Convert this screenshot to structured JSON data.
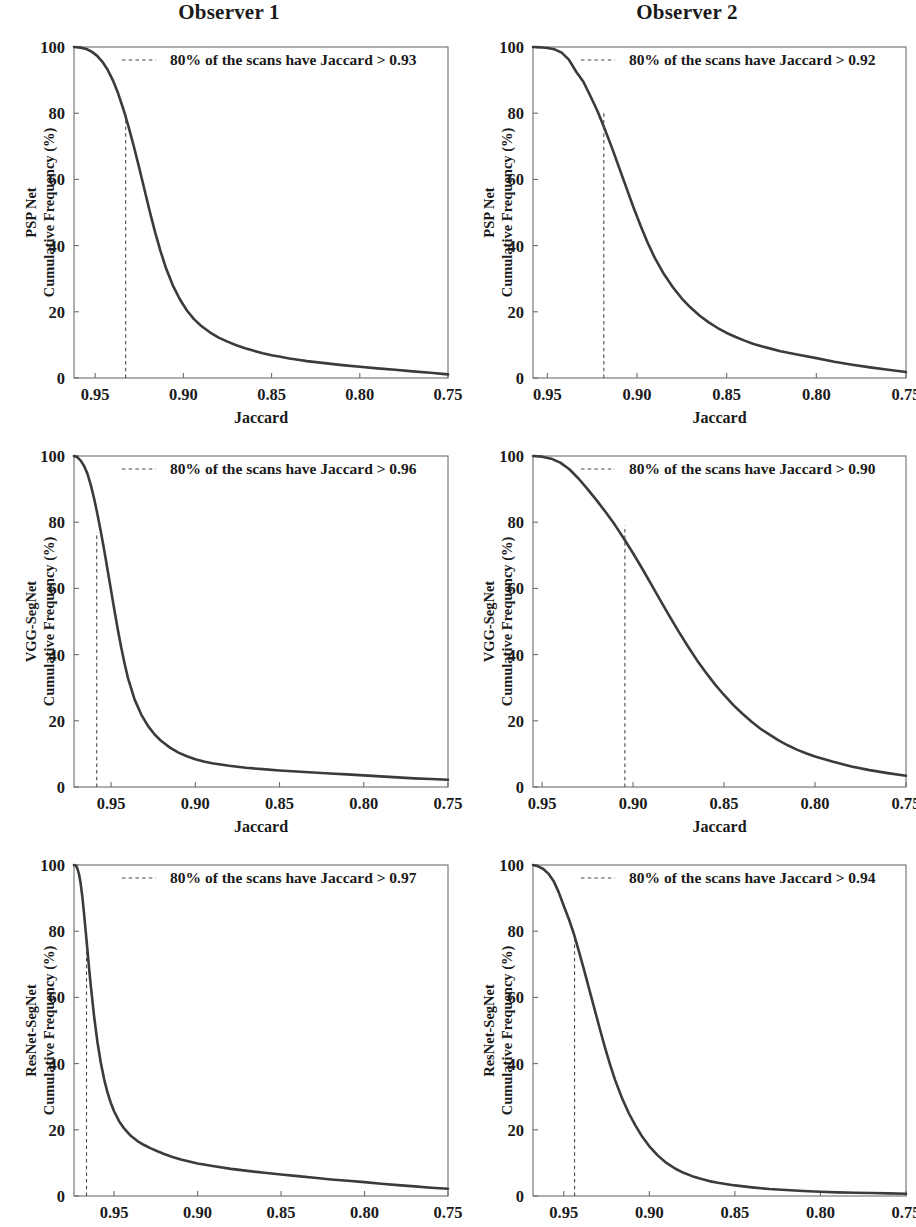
{
  "figure": {
    "column_titles": [
      "Observer 1",
      "Observer 2"
    ],
    "x_axis_title": "Jaccard",
    "y_axis_title_suffix": "Cumulative Frequency (%)",
    "row_models": [
      "PSP Net",
      "VGG-SegNet",
      "ResNet-SegNet"
    ],
    "curve_color": "#3b3b3b",
    "frame_color": "#6d6d6d",
    "dash_color": "#4a4a4a"
  },
  "chart_data": [
    {
      "id": "psp-observer1",
      "type": "line",
      "title": "Observer 1",
      "model": "PSP Net",
      "observer": "Observer 1",
      "xlabel": "Jaccard",
      "ylabel": "PSP Net Cumulative Frequency (%)",
      "xlim": [
        0.962,
        0.75
      ],
      "ylim": [
        0,
        100
      ],
      "xticks": [
        0.95,
        0.9,
        0.85,
        0.8,
        0.75
      ],
      "xticklabels": [
        "0.95",
        "0.90",
        "0.85",
        "0.80",
        "0.75"
      ],
      "yticks": [
        0,
        20,
        40,
        60,
        80,
        100
      ],
      "yticklabels": [
        "0",
        "20",
        "40",
        "60",
        "80",
        "100"
      ],
      "grid": false,
      "legend_position": "upper-center",
      "annotation": "80% of the scans have Jaccard > 0.93",
      "threshold_x": 0.9327,
      "threshold_y": 80,
      "x": [
        0.962,
        0.958,
        0.955,
        0.952,
        0.949,
        0.946,
        0.943,
        0.94,
        0.937,
        0.934,
        0.931,
        0.928,
        0.925,
        0.922,
        0.919,
        0.916,
        0.913,
        0.91,
        0.906,
        0.902,
        0.898,
        0.894,
        0.89,
        0.885,
        0.88,
        0.875,
        0.87,
        0.865,
        0.86,
        0.855,
        0.85,
        0.845,
        0.84,
        0.835,
        0.83,
        0.82,
        0.81,
        0.8,
        0.79,
        0.78,
        0.77,
        0.76,
        0.75
      ],
      "y": [
        100,
        99.8,
        99.4,
        98.6,
        97.4,
        95.6,
        93.2,
        90.0,
        86.0,
        81.2,
        75.8,
        69.8,
        63.4,
        56.8,
        50.2,
        44.0,
        38.4,
        33.4,
        28.0,
        23.8,
        20.4,
        17.8,
        15.8,
        13.8,
        12.2,
        11.0,
        9.9,
        9.0,
        8.2,
        7.5,
        6.9,
        6.4,
        5.9,
        5.5,
        5.1,
        4.5,
        3.9,
        3.4,
        2.9,
        2.5,
        2.0,
        1.6,
        1.1
      ]
    },
    {
      "id": "psp-observer2",
      "type": "line",
      "title": "Observer 2",
      "model": "PSP Net",
      "observer": "Observer 2",
      "xlabel": "Jaccard",
      "ylabel": "PSP Net Cumulative Frequency (%)",
      "xlim": [
        0.958,
        0.75
      ],
      "ylim": [
        0,
        100
      ],
      "xticks": [
        0.95,
        0.9,
        0.85,
        0.8,
        0.75
      ],
      "xticklabels": [
        "0.95",
        "0.90",
        "0.85",
        "0.80",
        "0.75"
      ],
      "yticks": [
        0,
        20,
        40,
        60,
        80,
        100
      ],
      "yticklabels": [
        "0",
        "20",
        "40",
        "60",
        "80",
        "100"
      ],
      "grid": false,
      "legend_position": "upper-center",
      "annotation": "80% of the scans have Jaccard > 0.92",
      "threshold_x": 0.9185,
      "threshold_y": 80,
      "x": [
        0.958,
        0.954,
        0.95,
        0.946,
        0.942,
        0.938,
        0.934,
        0.93,
        0.926,
        0.922,
        0.918,
        0.914,
        0.91,
        0.906,
        0.902,
        0.898,
        0.894,
        0.89,
        0.885,
        0.88,
        0.875,
        0.87,
        0.865,
        0.86,
        0.855,
        0.85,
        0.845,
        0.84,
        0.835,
        0.83,
        0.825,
        0.82,
        0.81,
        0.8,
        0.79,
        0.78,
        0.77,
        0.76,
        0.75
      ],
      "y": [
        100,
        99.9,
        99.7,
        99.3,
        98.3,
        96.2,
        92.6,
        89.6,
        85.2,
        80.6,
        75.2,
        69.6,
        63.6,
        57.6,
        51.6,
        46.0,
        40.8,
        36.2,
        31.4,
        27.4,
        24.0,
        21.2,
        18.8,
        16.8,
        15.1,
        13.6,
        12.4,
        11.3,
        10.3,
        9.5,
        8.8,
        8.1,
        7.0,
        6.0,
        4.9,
        4.0,
        3.2,
        2.5,
        1.8
      ]
    },
    {
      "id": "vgg-observer1",
      "type": "line",
      "title": "Observer 1",
      "model": "VGG-SegNet",
      "observer": "Observer 1",
      "xlabel": "Jaccard",
      "ylabel": "VGG-SegNet Cumulative Frequency (%)",
      "xlim": [
        0.972,
        0.75
      ],
      "ylim": [
        0,
        100
      ],
      "xticks": [
        0.95,
        0.9,
        0.85,
        0.8,
        0.75
      ],
      "xticklabels": [
        "0.95",
        "0.90",
        "0.85",
        "0.80",
        "0.75"
      ],
      "yticks": [
        0,
        20,
        40,
        60,
        80,
        100
      ],
      "yticklabels": [
        "0",
        "20",
        "40",
        "60",
        "80",
        "100"
      ],
      "grid": false,
      "legend_position": "upper-center",
      "annotation": "80% of the scans have Jaccard > 0.96",
      "threshold_x": 0.9585,
      "threshold_y": 77,
      "x": [
        0.972,
        0.97,
        0.968,
        0.966,
        0.964,
        0.962,
        0.96,
        0.958,
        0.956,
        0.954,
        0.952,
        0.95,
        0.948,
        0.946,
        0.944,
        0.942,
        0.94,
        0.936,
        0.932,
        0.928,
        0.924,
        0.92,
        0.915,
        0.91,
        0.905,
        0.9,
        0.895,
        0.89,
        0.88,
        0.87,
        0.86,
        0.85,
        0.84,
        0.83,
        0.82,
        0.81,
        0.8,
        0.79,
        0.78,
        0.77,
        0.76,
        0.75
      ],
      "y": [
        100,
        99.6,
        98.6,
        97.0,
        94.6,
        91.2,
        87.0,
        82.2,
        77.0,
        71.4,
        65.4,
        59.4,
        53.4,
        47.6,
        42.2,
        37.4,
        33.0,
        26.4,
        21.8,
        18.4,
        15.8,
        13.8,
        11.9,
        10.4,
        9.3,
        8.4,
        7.7,
        7.2,
        6.4,
        5.8,
        5.4,
        5.0,
        4.7,
        4.4,
        4.1,
        3.8,
        3.5,
        3.2,
        2.9,
        2.6,
        2.4,
        2.2
      ]
    },
    {
      "id": "vgg-observer2",
      "type": "line",
      "title": "Observer 2",
      "model": "VGG-SegNet",
      "observer": "Observer 2",
      "xlabel": "Jaccard",
      "ylabel": "VGG-SegNet Cumulative Frequency (%)",
      "xlim": [
        0.955,
        0.75
      ],
      "ylim": [
        0,
        100
      ],
      "xticks": [
        0.95,
        0.9,
        0.85,
        0.8,
        0.75
      ],
      "xticklabels": [
        "0.95",
        "0.90",
        "0.85",
        "0.80",
        "0.75"
      ],
      "yticks": [
        0,
        20,
        40,
        60,
        80,
        100
      ],
      "yticklabels": [
        "0",
        "20",
        "40",
        "60",
        "80",
        "100"
      ],
      "grid": false,
      "legend_position": "upper-center",
      "annotation": "80% of the scans have Jaccard > 0.90",
      "threshold_x": 0.9045,
      "threshold_y": 79,
      "x": [
        0.955,
        0.95,
        0.945,
        0.94,
        0.935,
        0.93,
        0.925,
        0.92,
        0.915,
        0.91,
        0.905,
        0.9,
        0.895,
        0.89,
        0.885,
        0.88,
        0.875,
        0.87,
        0.865,
        0.86,
        0.855,
        0.85,
        0.845,
        0.84,
        0.835,
        0.83,
        0.825,
        0.82,
        0.815,
        0.81,
        0.805,
        0.8,
        0.79,
        0.78,
        0.77,
        0.76,
        0.75
      ],
      "y": [
        100,
        99.8,
        99.2,
        98.0,
        96.0,
        93.2,
        90.0,
        86.6,
        83.0,
        79.2,
        75.0,
        70.6,
        66.0,
        61.2,
        56.4,
        51.6,
        47.0,
        42.6,
        38.4,
        34.6,
        31.0,
        27.8,
        24.8,
        22.2,
        19.8,
        17.6,
        15.8,
        14.1,
        12.6,
        11.3,
        10.2,
        9.2,
        7.6,
        6.2,
        5.1,
        4.2,
        3.4
      ]
    },
    {
      "id": "resnet-observer1",
      "type": "line",
      "title": "Observer 1",
      "model": "ResNet-SegNet",
      "observer": "Observer 1",
      "xlabel": "Jaccard",
      "ylabel": "ResNet-SegNet Cumulative Frequency (%)",
      "xlim": [
        0.974,
        0.75
      ],
      "ylim": [
        0,
        100
      ],
      "xticks": [
        0.95,
        0.9,
        0.85,
        0.8,
        0.75
      ],
      "xticklabels": [
        "0.95",
        "0.90",
        "0.85",
        "0.80",
        "0.75"
      ],
      "yticks": [
        0,
        20,
        40,
        60,
        80,
        100
      ],
      "yticklabels": [
        "0",
        "20",
        "40",
        "60",
        "80",
        "100"
      ],
      "grid": false,
      "legend_position": "upper-center",
      "annotation": "80% of the scans have Jaccard > 0.97",
      "threshold_x": 0.9665,
      "threshold_y": 75,
      "x": [
        0.974,
        0.973,
        0.972,
        0.971,
        0.97,
        0.969,
        0.968,
        0.967,
        0.966,
        0.965,
        0.964,
        0.962,
        0.96,
        0.958,
        0.956,
        0.954,
        0.952,
        0.95,
        0.947,
        0.944,
        0.94,
        0.936,
        0.932,
        0.928,
        0.924,
        0.92,
        0.915,
        0.91,
        0.9,
        0.89,
        0.88,
        0.87,
        0.86,
        0.85,
        0.84,
        0.83,
        0.82,
        0.81,
        0.8,
        0.79,
        0.78,
        0.77,
        0.76,
        0.75
      ],
      "y": [
        100,
        99.8,
        99.0,
        97.2,
        94.4,
        90.4,
        85.4,
        80.0,
        74.6,
        69.0,
        63.8,
        54.4,
        46.6,
        40.4,
        35.4,
        31.4,
        28.2,
        25.6,
        22.6,
        20.4,
        18.2,
        16.6,
        15.4,
        14.4,
        13.5,
        12.7,
        11.8,
        11.0,
        9.8,
        9.0,
        8.2,
        7.6,
        7.0,
        6.5,
        6.0,
        5.5,
        5.0,
        4.6,
        4.2,
        3.7,
        3.3,
        2.9,
        2.5,
        2.2
      ]
    },
    {
      "id": "resnet-observer2",
      "type": "line",
      "title": "Observer 2",
      "model": "ResNet-SegNet",
      "observer": "Observer 2",
      "xlabel": "Jaccard",
      "ylabel": "ResNet-SegNet Cumulative Frequency (%)",
      "xlim": [
        0.968,
        0.75
      ],
      "ylim": [
        0,
        100
      ],
      "xticks": [
        0.95,
        0.9,
        0.85,
        0.8,
        0.75
      ],
      "xticklabels": [
        "0.95",
        "0.90",
        "0.85",
        "0.80",
        "0.75"
      ],
      "yticks": [
        0,
        20,
        40,
        60,
        80,
        100
      ],
      "yticklabels": [
        "0",
        "20",
        "40",
        "60",
        "80",
        "100"
      ],
      "grid": false,
      "legend_position": "upper-center",
      "annotation": "80% of the scans have Jaccard > 0.94",
      "threshold_x": 0.9437,
      "threshold_y": 79,
      "x": [
        0.968,
        0.965,
        0.962,
        0.959,
        0.956,
        0.953,
        0.95,
        0.947,
        0.944,
        0.941,
        0.938,
        0.935,
        0.932,
        0.929,
        0.926,
        0.923,
        0.92,
        0.916,
        0.912,
        0.908,
        0.904,
        0.9,
        0.895,
        0.89,
        0.885,
        0.88,
        0.875,
        0.87,
        0.865,
        0.86,
        0.85,
        0.84,
        0.83,
        0.82,
        0.81,
        0.8,
        0.79,
        0.78,
        0.77,
        0.76,
        0.75
      ],
      "y": [
        100,
        99.6,
        98.8,
        97.4,
        95.2,
        91.8,
        87.6,
        83.6,
        79.0,
        73.6,
        68.0,
        62.2,
        56.4,
        50.6,
        45.0,
        39.8,
        35.0,
        29.6,
        25.0,
        21.2,
        17.8,
        15.0,
        12.2,
        10.0,
        8.3,
        7.0,
        6.0,
        5.2,
        4.5,
        4.0,
        3.2,
        2.6,
        2.1,
        1.8,
        1.5,
        1.3,
        1.1,
        1.0,
        0.9,
        0.8,
        0.7
      ]
    }
  ]
}
